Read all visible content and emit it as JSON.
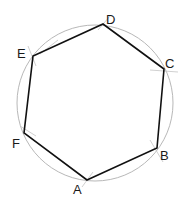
{
  "diagram": {
    "type": "inscribed-hexagon",
    "circle": {
      "cx": 95,
      "cy": 103,
      "r": 78,
      "stroke": "#b8b8b8"
    },
    "polygon_stroke": "#111111",
    "vertices": [
      {
        "label": "A",
        "x": 87,
        "y": 180,
        "lx": 73,
        "ly": 194
      },
      {
        "label": "B",
        "x": 157,
        "y": 148,
        "lx": 160,
        "ly": 160
      },
      {
        "label": "C",
        "x": 164,
        "y": 69,
        "lx": 165,
        "ly": 68
      },
      {
        "label": "D",
        "x": 103,
        "y": 24,
        "lx": 106,
        "ly": 24
      },
      {
        "label": "E",
        "x": 33,
        "y": 56,
        "lx": 17,
        "ly": 58
      },
      {
        "label": "F",
        "x": 24,
        "y": 133,
        "lx": 12,
        "ly": 148
      }
    ]
  },
  "labels": {
    "A": "A",
    "B": "B",
    "C": "C",
    "D": "D",
    "E": "E",
    "F": "F"
  }
}
